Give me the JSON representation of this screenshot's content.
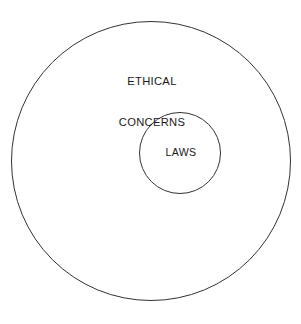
{
  "diagram": {
    "type": "nested-circles-euler-diagram",
    "background_color": "#FFFFFF",
    "stroke_color": "#333333",
    "stroke_width": 1,
    "outer_circle": {
      "label_line_1": "ETHICAL",
      "label_line_2": "CONCERNS",
      "label_full": "ETHICAL CONCERNS",
      "center_x": 151,
      "center_y": 161,
      "radius": 140,
      "fill": "none"
    },
    "inner_circle": {
      "label": "LAWS",
      "center_x": 180,
      "center_y": 153,
      "radius": 41,
      "fill": "none"
    }
  }
}
